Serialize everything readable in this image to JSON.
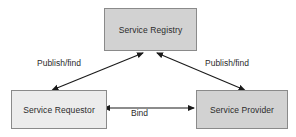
{
  "diagram": {
    "nodes": [
      {
        "id": "registry",
        "label": "Service Registry",
        "fill": "#d2d2d2",
        "stroke": "#8a8a8a"
      },
      {
        "id": "requestor",
        "label": "Service Requestor",
        "fill": "#ececec",
        "stroke": "#8a8a8a"
      },
      {
        "id": "provider",
        "label": "Service Provider",
        "fill": "#d2d2d2",
        "stroke": "#8a8a8a"
      }
    ],
    "edges": [
      {
        "id": "requestor-registry",
        "label": "Publish/find",
        "from": "requestor",
        "to": "registry",
        "arrows": "both"
      },
      {
        "id": "provider-registry",
        "label": "Publish/find",
        "from": "provider",
        "to": "registry",
        "arrows": "both"
      },
      {
        "id": "requestor-provider",
        "label": "Bind",
        "from": "requestor",
        "to": "provider",
        "arrows": "both"
      }
    ],
    "line_color": "#1a1a1a",
    "background": "#ffffff"
  }
}
